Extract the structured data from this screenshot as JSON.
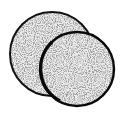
{
  "image": {
    "description": "Two overlapping stippled circles (discs)",
    "background": "#ffffff",
    "stroke_color": "#111111",
    "fill_base": "#e6e6e6",
    "speckle_color": "#4a4a4a",
    "shapes": [
      {
        "name": "back-disc",
        "cx": 52,
        "cy": 54,
        "r": 42
      },
      {
        "name": "front-disc",
        "cx": 77,
        "cy": 69,
        "r": 37
      }
    ]
  }
}
